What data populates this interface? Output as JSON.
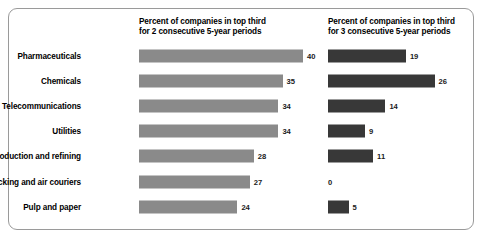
{
  "figure": {
    "headers": {
      "left": {
        "line1": "Percent of companies in top third",
        "line2": "for 2 consecutive 5-year periods"
      },
      "right": {
        "line1": "Percent of companies in top third",
        "line2": "for 3 consecutive 5-year periods"
      }
    },
    "colors": {
      "bar_left": "#8a8a8a",
      "bar_right": "#383838",
      "border": "#9a9a9a",
      "background": "#ffffff",
      "text": "#000000"
    }
  },
  "chart_data": {
    "type": "bar",
    "orientation": "horizontal",
    "title": "",
    "xlabel": "",
    "ylabel": "",
    "grid": false,
    "legend_position": "none",
    "axis_range": [
      0,
      40
    ],
    "pixels_per_unit": 4.1,
    "categories": [
      "Pharmaceuticals",
      "Chemicals",
      "Telecommunications",
      "Utilities",
      "Oil production and refining",
      "Trucking and air couriers",
      "Pulp and paper"
    ],
    "series": [
      {
        "name": "Percent of companies in top third for 2 consecutive 5-year periods",
        "color": "#8a8a8a",
        "values": [
          40,
          35,
          34,
          34,
          28,
          27,
          24
        ],
        "labels": [
          "40",
          "35",
          "34",
          "34",
          "28",
          "27",
          "24"
        ]
      },
      {
        "name": "Percent of companies in top third for 3 consecutive 5-year periods",
        "color": "#383838",
        "values": [
          19,
          26,
          14,
          9,
          11,
          0,
          5
        ],
        "labels": [
          "19",
          "26",
          "14",
          "9",
          "11",
          "0",
          "5"
        ]
      }
    ]
  }
}
